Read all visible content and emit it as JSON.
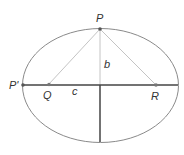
{
  "diagram": {
    "labels": {
      "p": "P",
      "p_prime": "P'",
      "q": "Q",
      "r": "R",
      "b": "b",
      "c": "c"
    },
    "colors": {
      "ellipse": "#8a8a8a",
      "axis": "#444444",
      "construction": "#bdbdbd",
      "point": "#555555"
    }
  }
}
